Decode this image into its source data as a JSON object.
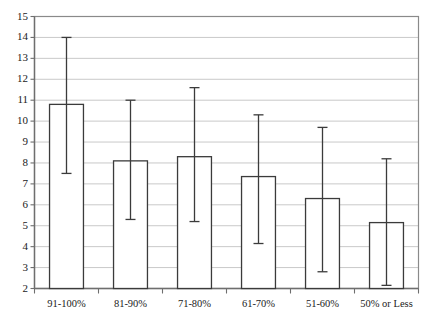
{
  "chart_data": {
    "type": "bar",
    "title": "",
    "subtitle": "",
    "xlabel": "",
    "ylabel": "",
    "categories": [
      "91-100%",
      "81-90%",
      "71-80%",
      "61-70%",
      "51-60%",
      "50% or Less"
    ],
    "values": [
      10.8,
      8.1,
      8.3,
      7.35,
      6.3,
      5.15
    ],
    "error_bars": {
      "type": "asymmetric-range",
      "upper": [
        14.0,
        11.0,
        11.6,
        10.3,
        9.7,
        8.2
      ],
      "lower": [
        7.5,
        5.3,
        5.2,
        4.15,
        2.8,
        2.15
      ]
    },
    "ylim": [
      2,
      15
    ],
    "yticks": [
      2,
      3,
      4,
      5,
      6,
      7,
      8,
      9,
      10,
      11,
      12,
      13,
      14,
      15
    ],
    "ytick_labels": [
      "2",
      "3",
      "4",
      "5",
      "6",
      "7",
      "8",
      "9",
      "10",
      "11",
      "12",
      "13",
      "14",
      "15"
    ],
    "grid": true,
    "grid_axis": "y",
    "legend": null,
    "bar_fill": "#ffffff",
    "bar_edge": "#3b3b3b",
    "error_color": "#3b3b3b",
    "grid_color": "#c9c9c9",
    "axis_color": "#8a8a8a",
    "plot_border": true,
    "annotations": []
  }
}
